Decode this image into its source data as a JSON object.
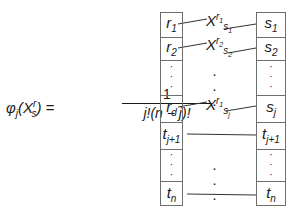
{
  "formula": {
    "lhs_text": "φ",
    "lhs_sub": "j",
    "lhs_arg_open": "(X",
    "lhs_arg_sup": "r",
    "lhs_arg_sub": "s",
    "lhs_arg_close": ") =",
    "numerator": "1",
    "denominator": "j!(n − j)!"
  },
  "left_column": {
    "cells": [
      {
        "base": "r",
        "sub": "1"
      },
      {
        "base": "r",
        "sub": "2"
      },
      {
        "base": "⋮",
        "sub": ""
      },
      {
        "base": "r",
        "sub": "d"
      },
      {
        "base": "t",
        "sub": "j+1"
      },
      {
        "base": "⋮",
        "sub": ""
      },
      {
        "base": "t",
        "sub": "n"
      }
    ]
  },
  "right_column": {
    "cells": [
      {
        "base": "s",
        "sub": "1"
      },
      {
        "base": "s",
        "sub": "2"
      },
      {
        "base": "⋮",
        "sub": ""
      },
      {
        "base": "s",
        "sub": "j"
      },
      {
        "base": "t",
        "sub": "j+1"
      },
      {
        "base": "⋮",
        "sub": ""
      },
      {
        "base": "t",
        "sub": "n"
      }
    ]
  },
  "middle_labels": [
    {
      "base": "X",
      "sup": "r",
      "sup_sub": "1",
      "sub": "s",
      "sub_sub": "1"
    },
    {
      "base": "X",
      "sup": "r",
      "sup_sub": "2",
      "sub": "s",
      "sub_sub": "2"
    },
    {
      "base": "⋮"
    },
    {
      "base": "X",
      "sup": "r",
      "sup_sub": "1",
      "sub": "s",
      "sub_sub": "j"
    },
    {
      "base": "⋮"
    }
  ]
}
